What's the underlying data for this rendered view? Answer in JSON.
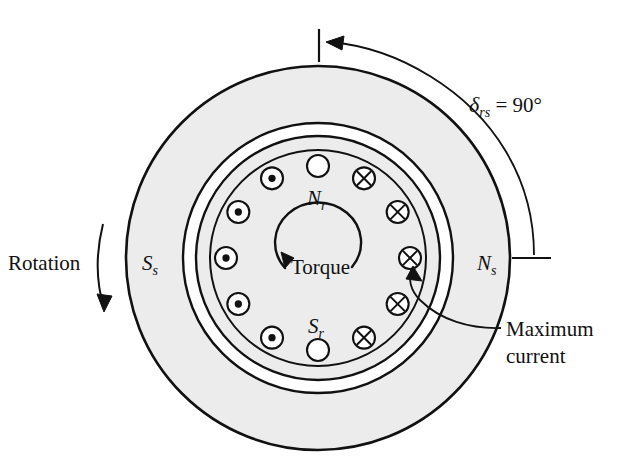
{
  "figure": {
    "background_color": "#ffffff",
    "line_color": "#111111",
    "fill_color": "#ececec"
  },
  "geometry": {
    "center_x": 318,
    "center_y": 258,
    "stator_outer_radius": 192,
    "stator_inner_radius": 135,
    "rotor_outer_radius": 122,
    "rotor_inner_radius": 108,
    "conductor_ring_radius": 92,
    "conductor_radius": 11
  },
  "labels": {
    "torque_angle": "δ",
    "torque_angle_sub": "rs",
    "torque_angle_value": " = 90°",
    "rotor_north": "N",
    "rotor_north_sub": "r",
    "rotor_south": "S",
    "rotor_south_sub": "r",
    "stator_north": "N",
    "stator_north_sub": "s",
    "stator_south": "S",
    "stator_south_sub": "s",
    "torque": "Torque",
    "rotation": "Rotation",
    "maximum_current_line1": "Maximum",
    "maximum_current_line2": "current"
  },
  "conductors": [
    {
      "index": 0,
      "angle_deg": -90,
      "type": "empty",
      "symbol": "",
      "note": "top reference slot"
    },
    {
      "index": 1,
      "angle_deg": -60,
      "type": "cross",
      "symbol": "×",
      "note": "current into page"
    },
    {
      "index": 2,
      "angle_deg": -30,
      "type": "cross",
      "symbol": "×",
      "note": "current into page"
    },
    {
      "index": 3,
      "angle_deg": 0,
      "type": "cross",
      "symbol": "×",
      "note": "maximum current into page"
    },
    {
      "index": 4,
      "angle_deg": 30,
      "type": "cross",
      "symbol": "×",
      "note": "current into page"
    },
    {
      "index": 5,
      "angle_deg": 60,
      "type": "cross",
      "symbol": "×",
      "note": "current into page"
    },
    {
      "index": 6,
      "angle_deg": 90,
      "type": "empty",
      "symbol": "",
      "note": "bottom reference slot"
    },
    {
      "index": 7,
      "angle_deg": 120,
      "type": "dot",
      "symbol": "•",
      "note": "current out of page"
    },
    {
      "index": 8,
      "angle_deg": 150,
      "type": "dot",
      "symbol": "•",
      "note": "current out of page"
    },
    {
      "index": 9,
      "angle_deg": 180,
      "type": "dot",
      "symbol": "•",
      "note": "current out of page"
    },
    {
      "index": 10,
      "angle_deg": 210,
      "type": "dot",
      "symbol": "•",
      "note": "current out of page"
    },
    {
      "index": 11,
      "angle_deg": 240,
      "type": "dot",
      "symbol": "•",
      "note": "current out of page"
    }
  ],
  "annotations": {
    "angle_arc": {
      "from": "top tick",
      "to": "right tick",
      "span_deg": 90,
      "arrowhead": "at top"
    },
    "rotation_arrow": {
      "direction": "clockwise",
      "position": "left of stator"
    },
    "torque_arrow": {
      "direction": "clockwise",
      "position": "rotor center"
    },
    "maximum_current_leader": {
      "points_to_conductor_index": 3
    }
  }
}
